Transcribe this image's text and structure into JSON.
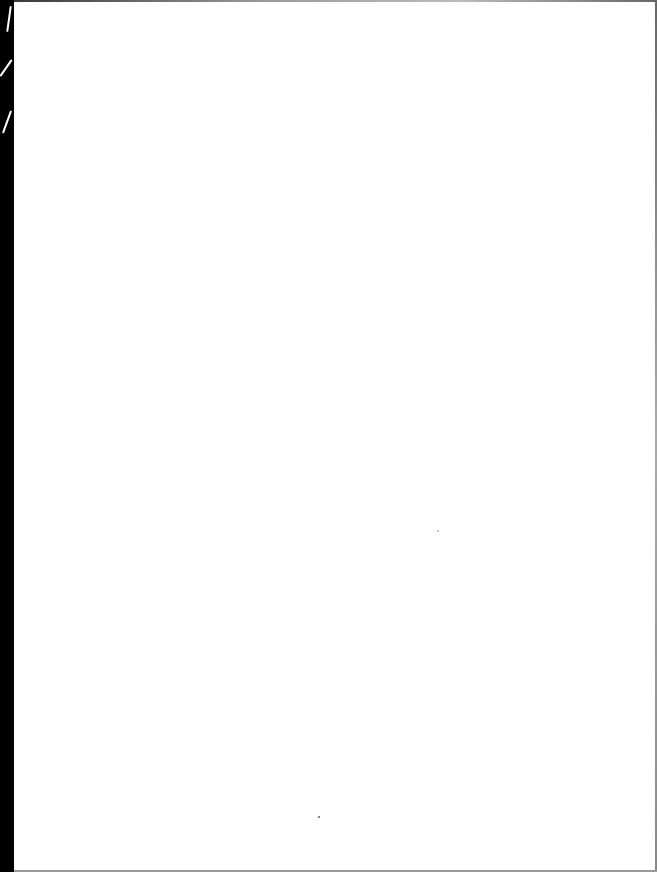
{
  "document": {
    "type": "blank scanned page",
    "text": "",
    "colors": {
      "paper": "#ffffff",
      "binding_strip": "#000000",
      "edge": "#999999"
    }
  }
}
